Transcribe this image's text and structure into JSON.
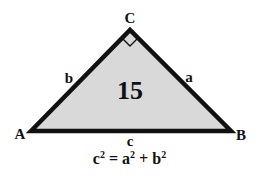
{
  "diagram": {
    "center_number": "15",
    "vertices": {
      "A": "A",
      "B": "B",
      "C": "C"
    },
    "sides": {
      "a": "a",
      "b": "b",
      "c": "c"
    },
    "right_angle_at": "C",
    "formula": {
      "lhs_base": "c",
      "lhs_exp": "2",
      "equals": " = ",
      "term1_base": "a",
      "term1_exp": "2",
      "plus": " + ",
      "term2_base": "b",
      "term2_exp": "2"
    },
    "colors": {
      "fill": "#d9d9d9",
      "stroke": "#111111",
      "text": "#111111",
      "background": "#ffffff"
    }
  }
}
